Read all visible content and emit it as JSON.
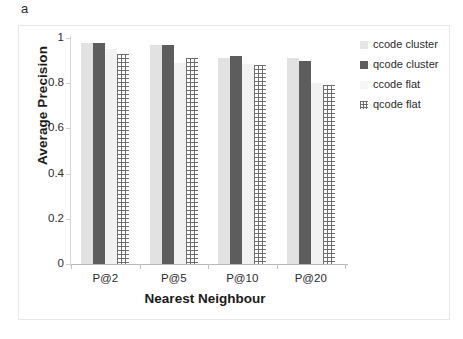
{
  "panel": {
    "label": "a"
  },
  "chart_data": {
    "type": "bar",
    "title": "",
    "xlabel": "Nearest Neighbour",
    "ylabel": "Average Precision",
    "categories": [
      "P@2",
      "P@5",
      "P@10",
      "P@20"
    ],
    "series": [
      {
        "name": "ccode cluster",
        "color": "#e2e2e2",
        "pattern": "solid-light",
        "values": [
          0.98,
          0.97,
          0.91,
          0.91
        ]
      },
      {
        "name": "qcode cluster",
        "color": "#5d5d5d",
        "pattern": "solid-dark",
        "values": [
          0.98,
          0.97,
          0.92,
          0.9
        ]
      },
      {
        "name": "ccode flat",
        "color": "#f2f2f2",
        "pattern": "solid-white",
        "values": [
          0.95,
          0.89,
          0.885,
          0.8
        ]
      },
      {
        "name": "qcode flat",
        "color": "#6e6e6e",
        "pattern": "grid-hatch",
        "values": [
          0.93,
          0.91,
          0.88,
          0.79
        ]
      }
    ],
    "ylim": [
      0,
      1
    ],
    "yticks": [
      "0",
      "0.2",
      "0.4",
      "0.6",
      "0.8",
      "1"
    ],
    "ytick_values": [
      0,
      0.2,
      0.4,
      0.6,
      0.8,
      1
    ],
    "grid": false,
    "legend_position": "right"
  }
}
